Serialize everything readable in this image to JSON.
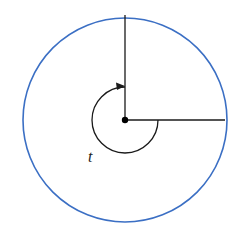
{
  "diagram": {
    "circle_color": "#3b6fc4",
    "line_color": "#1a1a1a",
    "angle_label": "t"
  }
}
